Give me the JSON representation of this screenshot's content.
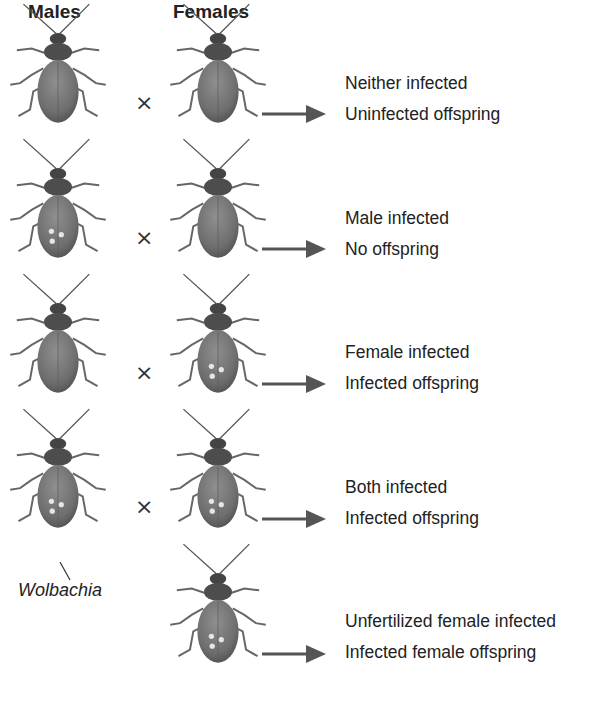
{
  "headers": {
    "males": "Males",
    "females": "Females"
  },
  "cross_symbol": "×",
  "rows": [
    {
      "male": "uninfected",
      "female": "uninfected",
      "condition": "Neither infected",
      "result": "Uninfected offspring"
    },
    {
      "male": "infected",
      "female": "uninfected",
      "condition": "Male infected",
      "result": "No offspring"
    },
    {
      "male": "uninfected",
      "female": "infected",
      "condition": "Female infected",
      "result": "Infected offspring"
    },
    {
      "male": "infected",
      "female": "infected",
      "condition": "Both infected",
      "result": "Infected offspring"
    },
    {
      "male": null,
      "female": "infected",
      "condition": "Unfertilized female infected",
      "result": "Infected female offspring"
    }
  ],
  "annotation": {
    "label": "Wolbachia",
    "points_to": "bacteria spots in male beetle row 4"
  },
  "colors": {
    "elytra": "#7a7a7a",
    "head": "#4a4a4a",
    "spots": "#e6e6e6",
    "arrow": "#555555",
    "text": "#222222"
  }
}
